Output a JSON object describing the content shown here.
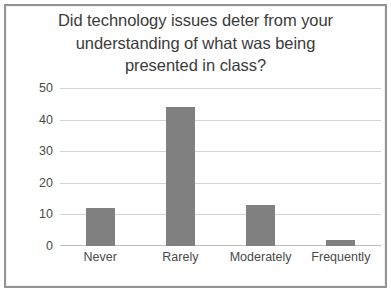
{
  "chart_data": {
    "type": "bar",
    "title": "Did technology issues deter from your understanding of what was being presented in class?",
    "title_lines": [
      "Did technology issues deter from your",
      "understanding of what was being",
      "presented in class?"
    ],
    "categories": [
      "Never",
      "Rarely",
      "Moderately",
      "Frequently"
    ],
    "values": [
      12,
      44,
      13,
      2
    ],
    "series": [
      {
        "name": "Responses",
        "values": [
          12,
          44,
          13,
          2
        ]
      }
    ],
    "xlabel": "",
    "ylabel": "",
    "ylim": [
      0,
      50
    ],
    "y_ticks": [
      0,
      10,
      20,
      30,
      40,
      50
    ],
    "y_tick_labels": [
      "0",
      "10",
      "20",
      "30",
      "40",
      "50"
    ],
    "grid": true,
    "legend": false,
    "legend_position": "none",
    "colors": {
      "bar": "#808080",
      "gridline": "#d4d4d4",
      "baseline": "#bfbfbf",
      "title_text": "#3b3b3b",
      "tick_text": "#4a4a4a",
      "border": "#939393",
      "background": "#ffffff"
    }
  }
}
